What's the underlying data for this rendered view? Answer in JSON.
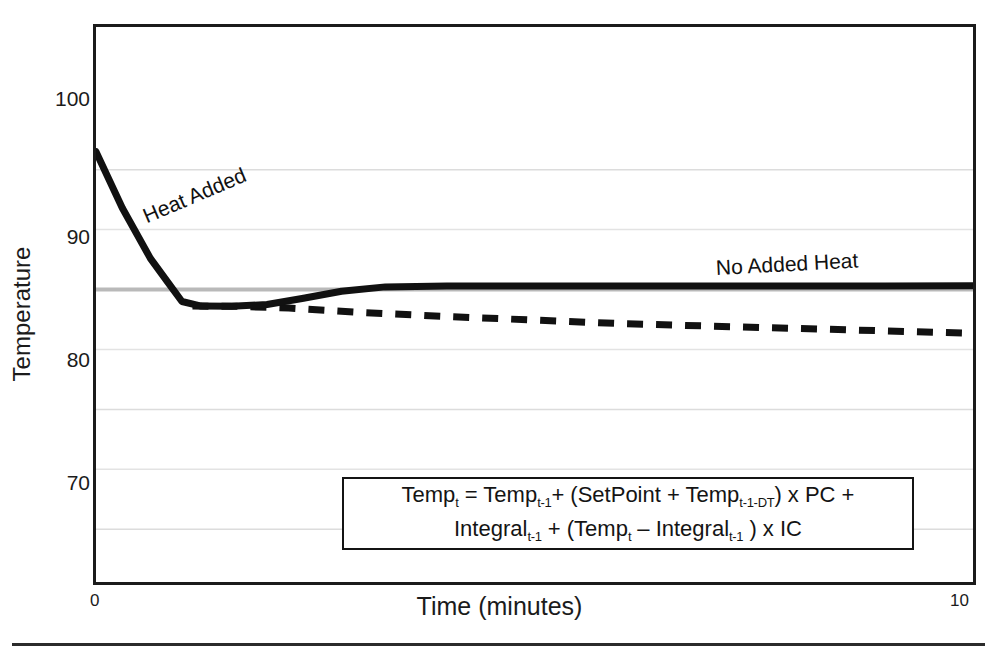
{
  "chart_data": {
    "type": "line",
    "title": "",
    "subtitle": "",
    "xlabel": "Time (minutes)",
    "ylabel": "Temperature",
    "xlim": [
      0,
      10
    ],
    "ylim": [
      65.6,
      111.9
    ],
    "xticks": [
      "0",
      "10"
    ],
    "yticks": [
      "70",
      "80",
      "90",
      "100"
    ],
    "ytick_values": [
      70,
      80,
      90,
      100
    ],
    "gridlines_y": [
      70,
      75,
      80,
      85,
      90,
      95,
      100
    ],
    "grid": "horizontal-only",
    "legend": "inline-annotations",
    "setpoint": 90,
    "series": [
      {
        "name": "Heat Added",
        "style": "solid",
        "color": "#111111",
        "x": [
          0.0,
          0.3,
          0.62,
          0.82,
          0.98,
          1.2,
          1.55,
          1.95,
          2.35,
          2.8,
          3.3,
          4.0,
          5.0,
          6.0,
          7.0,
          8.0,
          9.0,
          10.0
        ],
        "y": [
          101.5,
          96.8,
          92.6,
          90.6,
          89.0,
          88.62,
          88.6,
          88.75,
          89.25,
          89.85,
          90.22,
          90.3,
          90.3,
          90.3,
          90.3,
          90.3,
          90.3,
          90.32
        ]
      },
      {
        "name": "No Added Heat",
        "style": "dashed",
        "color": "#111111",
        "x": [
          1.1,
          1.6,
          2.2,
          3.0,
          4.0,
          5.0,
          6.0,
          7.0,
          8.0,
          9.0,
          10.0
        ],
        "y": [
          88.62,
          88.6,
          88.45,
          88.1,
          87.75,
          87.45,
          87.15,
          86.95,
          86.75,
          86.55,
          86.35
        ]
      }
    ],
    "annotations": [
      {
        "text": "Heat Added",
        "rotation_deg": -23
      },
      {
        "text": "No Added Heat",
        "rotation_deg": -3
      }
    ]
  },
  "axis": {
    "y_title": "Temperature",
    "x_title": "Time (minutes)",
    "y_ticks": [
      "100",
      "90",
      "80",
      "70"
    ],
    "x_tick_min": "0",
    "x_tick_max": "10"
  },
  "labels": {
    "heat_added": "Heat Added",
    "no_added_heat": "No Added Heat"
  },
  "formula": {
    "line1": {
      "p1": "Temp",
      "s1": "t",
      "p2": " = Temp",
      "s2": "t-1",
      "p3": "+ (SetPoint + Temp",
      "s3": "t-1-DT",
      "p4": ") x PC +"
    },
    "line2": {
      "p1": "Integral",
      "s1": "t-1",
      "p2": " + (Temp",
      "s2": "t",
      "p3": " – Integral",
      "s3": "t-1",
      "p4": " ) x IC"
    }
  },
  "colors": {
    "ink": "#111111",
    "frame": "#1b1b1b",
    "gridline": "#d9d9d9",
    "setpoint_line": "#b3b3b3",
    "background": "#ffffff"
  }
}
